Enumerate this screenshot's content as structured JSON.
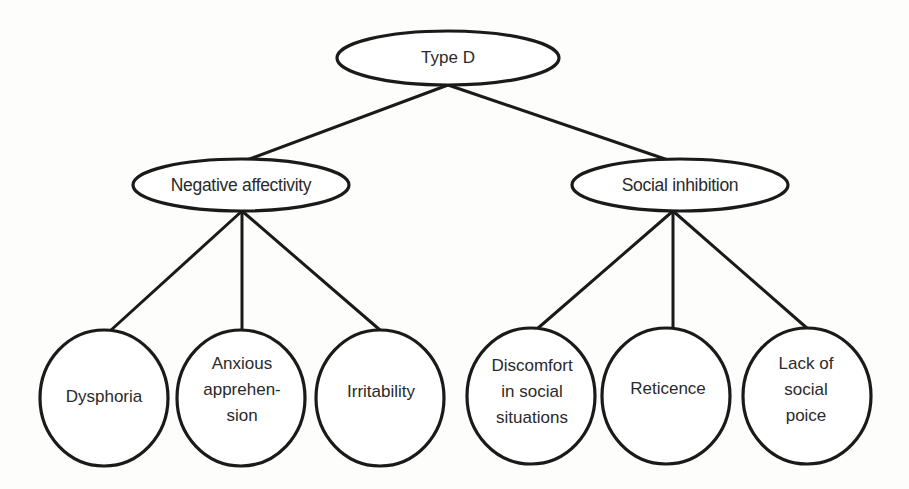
{
  "diagram": {
    "type": "hierarchy-tree",
    "root": {
      "id": "type-d",
      "label": "Type D",
      "shape": "ellipse",
      "cx": 448,
      "cy": 58,
      "rx": 111,
      "ry": 27
    },
    "branches": [
      {
        "id": "negative-affectivity",
        "label": "Negative affectivity",
        "shape": "ellipse",
        "cx": 241,
        "cy": 185,
        "rx": 108,
        "ry": 26,
        "children": [
          {
            "id": "dysphoria",
            "label": "Dysphoria",
            "cx": 104,
            "cy": 398,
            "rx": 64,
            "ry": 68
          },
          {
            "id": "anxious-apprehension",
            "label": "Anxious\napprehen-\nsion",
            "cx": 241,
            "cy": 398,
            "rx": 64,
            "ry": 68
          },
          {
            "id": "irritability",
            "label": "Irritability",
            "cx": 380,
            "cy": 398,
            "rx": 64,
            "ry": 68
          }
        ]
      },
      {
        "id": "social-inhibition",
        "label": "Social inhibition",
        "shape": "ellipse",
        "cx": 680,
        "cy": 185,
        "rx": 108,
        "ry": 26,
        "children": [
          {
            "id": "discomfort-social-situations",
            "label": "Discomfort\nin social\nsituations",
            "cx": 531,
            "cy": 396,
            "rx": 64,
            "ry": 68
          },
          {
            "id": "reticence",
            "label": "Reticence",
            "cx": 666,
            "cy": 396,
            "rx": 64,
            "ry": 68
          },
          {
            "id": "lack-of-social-poice",
            "label": "Lack of\nsocial\npoice",
            "cx": 807,
            "cy": 396,
            "rx": 64,
            "ry": 68
          }
        ]
      }
    ],
    "colors": {
      "stroke": "#1a1a1a",
      "text": "#2a2a2a",
      "background": "#fdfdfc"
    }
  }
}
